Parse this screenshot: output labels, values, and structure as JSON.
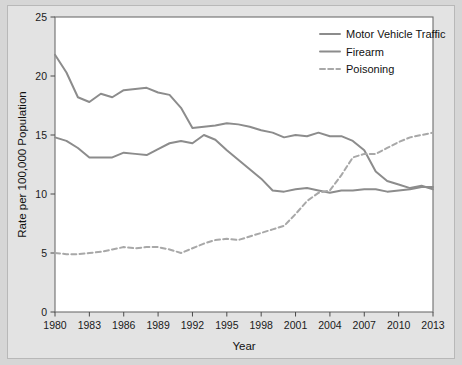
{
  "figure": {
    "background_color": "#d6d6d6",
    "panel_color": "#e3e3e3",
    "plot_background_color": "#ffffff",
    "plot_border_color": "#6e6e6e"
  },
  "chart_data": {
    "type": "line",
    "title": "",
    "xlabel": "Year",
    "ylabel": "Rate per 100,000 Population",
    "xlim": [
      1980,
      2013
    ],
    "ylim": [
      0,
      25
    ],
    "grid": false,
    "legend_position": "top-right",
    "x_tick_labels": [
      "1980",
      "1983",
      "1986",
      "1989",
      "1992",
      "1995",
      "1998",
      "2001",
      "2004",
      "2007",
      "2010",
      "2013"
    ],
    "x_ticks": [
      1980,
      1983,
      1986,
      1989,
      1992,
      1995,
      1998,
      2001,
      2004,
      2007,
      2010,
      2013
    ],
    "y_tick_labels": [
      "0",
      "5",
      "10",
      "15",
      "20",
      "25"
    ],
    "y_ticks": [
      0,
      5,
      10,
      15,
      20,
      25
    ],
    "x": [
      1980,
      1981,
      1982,
      1983,
      1984,
      1985,
      1986,
      1987,
      1988,
      1989,
      1990,
      1991,
      1992,
      1993,
      1994,
      1995,
      1996,
      1997,
      1998,
      1999,
      2000,
      2001,
      2002,
      2003,
      2004,
      2005,
      2006,
      2007,
      2008,
      2009,
      2010,
      2011,
      2012,
      2013
    ],
    "series": [
      {
        "name": "Motor Vehicle Traffic",
        "color": "#8c8c8c",
        "style": "solid",
        "values": [
          21.8,
          20.3,
          18.2,
          17.8,
          18.5,
          18.2,
          18.8,
          18.9,
          19.0,
          18.6,
          18.4,
          17.3,
          15.6,
          15.7,
          15.8,
          16.0,
          15.9,
          15.7,
          15.4,
          15.2,
          14.8,
          15.0,
          14.9,
          15.2,
          14.9,
          14.9,
          14.5,
          13.7,
          11.9,
          11.1,
          10.8,
          10.5,
          10.7,
          10.4
        ]
      },
      {
        "name": "Firearm",
        "color": "#8c8c8c",
        "style": "solid",
        "values": [
          14.8,
          14.5,
          13.9,
          13.1,
          13.1,
          13.1,
          13.5,
          13.4,
          13.3,
          13.8,
          14.3,
          14.5,
          14.3,
          15.0,
          14.6,
          13.7,
          12.9,
          12.1,
          11.3,
          10.3,
          10.2,
          10.4,
          10.5,
          10.3,
          10.1,
          10.3,
          10.3,
          10.4,
          10.4,
          10.2,
          10.3,
          10.4,
          10.6,
          10.6
        ]
      },
      {
        "name": "Poisoning",
        "color": "#a8a8a8",
        "style": "dashed",
        "values": [
          5.0,
          4.9,
          4.9,
          5.0,
          5.1,
          5.3,
          5.5,
          5.4,
          5.5,
          5.5,
          5.3,
          5.0,
          5.4,
          5.8,
          6.1,
          6.2,
          6.1,
          6.4,
          6.7,
          7.0,
          7.3,
          8.3,
          9.4,
          10.1,
          10.3,
          11.6,
          13.1,
          13.4,
          13.4,
          13.9,
          14.4,
          14.8,
          15.0,
          15.2
        ]
      }
    ]
  },
  "legend": {
    "items": [
      {
        "label": "Motor Vehicle Traffic",
        "color": "#8c8c8c",
        "style": "solid"
      },
      {
        "label": "Firearm",
        "color": "#8c8c8c",
        "style": "solid"
      },
      {
        "label": "Poisoning",
        "color": "#a8a8a8",
        "style": "dashed"
      }
    ]
  }
}
